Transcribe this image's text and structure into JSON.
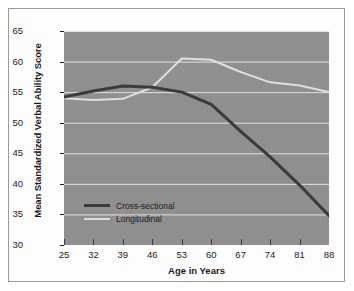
{
  "chart_data": {
    "type": "line",
    "title": "",
    "xlabel": "Age in Years",
    "ylabel": "Mean Standardized Verbal Ability Score",
    "x": [
      25,
      32,
      39,
      46,
      53,
      60,
      67,
      74,
      81,
      88
    ],
    "xticklabels": [
      "25",
      "32",
      "39",
      "46",
      "53",
      "60",
      "67",
      "74",
      "81",
      "88"
    ],
    "yticklabels": [
      "30",
      "35",
      "40",
      "45",
      "50",
      "55",
      "60",
      "65"
    ],
    "yticks": [
      30,
      35,
      40,
      45,
      50,
      55,
      60,
      65
    ],
    "xlim": [
      25,
      88
    ],
    "ylim": [
      30,
      65
    ],
    "grid": true,
    "legend_position": "lower-left-inside",
    "series": [
      {
        "name": "Cross-sectional",
        "color": "#3b3b3b",
        "width": 3,
        "values": [
          54.2,
          55.2,
          56.0,
          55.8,
          55.0,
          53.0,
          48.6,
          44.4,
          39.8,
          34.8
        ]
      },
      {
        "name": "Longitudinal",
        "color": "#dedede",
        "width": 2,
        "values": [
          54.0,
          53.7,
          53.9,
          55.8,
          60.5,
          60.3,
          58.3,
          56.6,
          56.1,
          55.0
        ]
      }
    ]
  },
  "axes": {
    "y_title": "Mean Standardized Verbal Ability Score",
    "x_title": "Age in Years"
  },
  "legend": {
    "items": [
      {
        "label": "Cross-sectional",
        "color": "#3b3b3b"
      },
      {
        "label": "Longitudinal",
        "color": "#dedede"
      }
    ]
  },
  "colors": {
    "plot_background": "#8f8f8f",
    "gridline": "#e2e2e2",
    "figure_background": "#fdfdfd",
    "border": "#9a9a9a",
    "cross_sectional": "#3b3b3b",
    "longitudinal": "#dedede"
  }
}
